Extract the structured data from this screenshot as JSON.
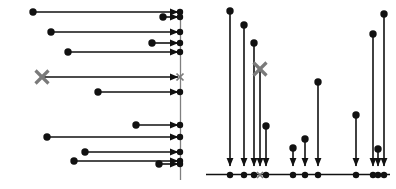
{
  "figure": {
    "background_color": "#ffffff",
    "width": 396,
    "height": 189,
    "stroke_color": "#111111",
    "marked_color": "#7a7a7a",
    "axis_color": "#7f7f7f",
    "dot_radius": 3.2,
    "line_width": 1.6,
    "axis_line_width": 1.3,
    "arrow_head_length": 9,
    "arrow_head_width": 7
  },
  "panels": [
    {
      "id": "left-panel",
      "name": "horizontal-arrows-panel",
      "orientation": "horizontal",
      "description": "Horizontal arrows pointing rightward from a start dot to a common vertical reference line",
      "axis": {
        "type": "vertical-line",
        "x": 180.5,
        "y_top": 10,
        "y_bottom": 180,
        "visible": true
      },
      "arrows": [
        {
          "id": "L1",
          "start_x": 33,
          "end_x": 180,
          "y": 12,
          "marked": false,
          "start_marker": "dot"
        },
        {
          "id": "L2",
          "start_x": 163,
          "end_x": 180,
          "y": 17,
          "marked": false,
          "start_marker": "dot"
        },
        {
          "id": "L3",
          "start_x": 51,
          "end_x": 180,
          "y": 32,
          "marked": false,
          "start_marker": "dot"
        },
        {
          "id": "L4",
          "start_x": 152,
          "end_x": 180,
          "y": 43,
          "marked": false,
          "start_marker": "dot"
        },
        {
          "id": "L5",
          "start_x": 68,
          "end_x": 180,
          "y": 52,
          "marked": false,
          "start_marker": "dot"
        },
        {
          "id": "L6",
          "start_x": 42,
          "end_x": 180,
          "y": 77,
          "marked": true,
          "start_marker": "cross"
        },
        {
          "id": "L7",
          "start_x": 98,
          "end_x": 180,
          "y": 92,
          "marked": false,
          "start_marker": "dot"
        },
        {
          "id": "L8",
          "start_x": 136,
          "end_x": 180,
          "y": 125,
          "marked": false,
          "start_marker": "dot"
        },
        {
          "id": "L9",
          "start_x": 47,
          "end_x": 180,
          "y": 137,
          "marked": false,
          "start_marker": "dot"
        },
        {
          "id": "L10",
          "start_x": 85,
          "end_x": 180,
          "y": 152,
          "marked": false,
          "start_marker": "dot"
        },
        {
          "id": "L11",
          "start_x": 74,
          "end_x": 180,
          "y": 161,
          "marked": false,
          "start_marker": "dot"
        },
        {
          "id": "L12",
          "start_x": 159,
          "end_x": 180,
          "y": 164,
          "marked": false,
          "start_marker": "dot"
        }
      ],
      "target_dots": [
        {
          "id": "LT1",
          "x": 180,
          "y": 12,
          "marked": false
        },
        {
          "id": "LT2",
          "x": 180,
          "y": 17,
          "marked": false
        },
        {
          "id": "LT3",
          "x": 180,
          "y": 32,
          "marked": false
        },
        {
          "id": "LT4",
          "x": 180,
          "y": 43,
          "marked": false
        },
        {
          "id": "LT5",
          "x": 180,
          "y": 52,
          "marked": false
        },
        {
          "id": "LT6",
          "x": 180,
          "y": 77,
          "marked": true
        },
        {
          "id": "LT7",
          "x": 180,
          "y": 92,
          "marked": false
        },
        {
          "id": "LT8",
          "x": 180,
          "y": 125,
          "marked": false
        },
        {
          "id": "LT9",
          "x": 180,
          "y": 137,
          "marked": false
        },
        {
          "id": "LT10",
          "x": 180,
          "y": 152,
          "marked": false
        },
        {
          "id": "LT11",
          "x": 180,
          "y": 161,
          "marked": false
        },
        {
          "id": "LT12",
          "x": 180,
          "y": 164,
          "marked": false
        }
      ]
    },
    {
      "id": "right-panel",
      "name": "vertical-arrows-panel",
      "orientation": "vertical",
      "description": "Vertical arrows pointing downward from a start dot to a common horizontal baseline axis",
      "axis": {
        "type": "horizontal-line",
        "y": 174.5,
        "x_left": 8,
        "x_right": 192,
        "visible": true
      },
      "arrows": [
        {
          "id": "R1",
          "x": 32,
          "start_y": 11,
          "end_y": 168,
          "marked": false,
          "start_marker": "dot"
        },
        {
          "id": "R2",
          "x": 46,
          "start_y": 25,
          "end_y": 168,
          "marked": false,
          "start_marker": "dot"
        },
        {
          "id": "R3",
          "x": 56,
          "start_y": 43,
          "end_y": 168,
          "marked": false,
          "start_marker": "dot"
        },
        {
          "id": "R4",
          "x": 62,
          "start_y": 69,
          "end_y": 168,
          "marked": true,
          "start_marker": "cross"
        },
        {
          "id": "R5",
          "x": 68,
          "start_y": 126,
          "end_y": 168,
          "marked": false,
          "start_marker": "dot"
        },
        {
          "id": "R6",
          "x": 95,
          "start_y": 148,
          "end_y": 168,
          "marked": false,
          "start_marker": "dot"
        },
        {
          "id": "R7",
          "x": 107,
          "start_y": 139,
          "end_y": 168,
          "marked": false,
          "start_marker": "dot"
        },
        {
          "id": "R8",
          "x": 120,
          "start_y": 82,
          "end_y": 168,
          "marked": false,
          "start_marker": "dot"
        },
        {
          "id": "R9",
          "x": 158,
          "start_y": 115,
          "end_y": 168,
          "marked": false,
          "start_marker": "dot"
        },
        {
          "id": "R10",
          "x": 175,
          "start_y": 34,
          "end_y": 168,
          "marked": false,
          "start_marker": "dot"
        },
        {
          "id": "R11",
          "x": 180,
          "start_y": 149,
          "end_y": 168,
          "marked": false,
          "start_marker": "dot"
        },
        {
          "id": "R12",
          "x": 186,
          "start_y": 14,
          "end_y": 168,
          "marked": false,
          "start_marker": "dot"
        }
      ],
      "baseline_dots": [
        {
          "id": "RB1",
          "x": 32,
          "y": 175,
          "marked": false
        },
        {
          "id": "RB2",
          "x": 46,
          "y": 175,
          "marked": false
        },
        {
          "id": "RB3",
          "x": 56,
          "y": 175,
          "marked": false
        },
        {
          "id": "RB4",
          "x": 62,
          "y": 175,
          "marked": true
        },
        {
          "id": "RB5",
          "x": 68,
          "y": 175,
          "marked": false
        },
        {
          "id": "RB6",
          "x": 95,
          "y": 175,
          "marked": false
        },
        {
          "id": "RB7",
          "x": 107,
          "y": 175,
          "marked": false
        },
        {
          "id": "RB8",
          "x": 120,
          "y": 175,
          "marked": false
        },
        {
          "id": "RB9",
          "x": 158,
          "y": 175,
          "marked": false
        },
        {
          "id": "RB10",
          "x": 175,
          "y": 175,
          "marked": false
        },
        {
          "id": "RB11",
          "x": 180,
          "y": 175,
          "marked": false
        },
        {
          "id": "RB12",
          "x": 186,
          "y": 175,
          "marked": false
        }
      ]
    }
  ],
  "chart_data": {
    "type": "scatter",
    "title": "",
    "subtitle": "",
    "xlabel": "",
    "ylabel": "",
    "grid": false,
    "legend": null,
    "annotations": [
      {
        "text": "×",
        "panel": "left-panel",
        "x": 42,
        "y": 77,
        "note": "marked item start, gray cross"
      },
      {
        "text": "×",
        "panel": "left-panel",
        "x": 180,
        "y": 77,
        "note": "marked item target, small gray cross"
      },
      {
        "text": "×",
        "panel": "right-panel",
        "x": 62,
        "y": 69,
        "note": "marked item start, gray cross"
      },
      {
        "text": "×",
        "panel": "right-panel",
        "x": 62,
        "y": 175,
        "note": "marked item baseline, small gray cross"
      }
    ],
    "series": [
      {
        "name": "left-panel-arrow-lengths",
        "note": "horizontal arrow span in px, from start dot to the vertical reference line at x=180",
        "categories": [
          "L1",
          "L2",
          "L3",
          "L4",
          "L5",
          "L6",
          "L7",
          "L8",
          "L9",
          "L10",
          "L11",
          "L12"
        ],
        "values": [
          147,
          17,
          129,
          28,
          112,
          138,
          82,
          44,
          133,
          95,
          106,
          21
        ]
      },
      {
        "name": "right-panel-arrow-lengths",
        "note": "vertical arrow span in px, from start dot down to the baseline axis at y=174",
        "categories": [
          "R1",
          "R2",
          "R3",
          "R4",
          "R5",
          "R6",
          "R7",
          "R8",
          "R9",
          "R10",
          "R11",
          "R12"
        ],
        "values": [
          157,
          143,
          125,
          99,
          42,
          20,
          29,
          86,
          53,
          134,
          19,
          154
        ]
      }
    ],
    "xlim": [
      0,
      396
    ],
    "ylim": [
      0,
      189
    ]
  }
}
